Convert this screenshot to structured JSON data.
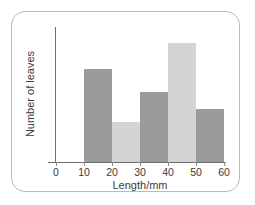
{
  "chart_data": {
    "type": "bar",
    "title": "",
    "subtitle": "",
    "xlabel": "Length/mm",
    "ylabel": "Number of leaves",
    "grid": false,
    "legend": "none",
    "xlim": [
      0,
      60
    ],
    "bin_width": 10,
    "xticks": [
      "0",
      "10",
      "20",
      "30",
      "40",
      "50",
      "60"
    ],
    "xtick_values": [
      0,
      10,
      20,
      30,
      40,
      50,
      60
    ],
    "yticks": [],
    "ylim": [
      0,
      10
    ],
    "categories": [
      "10-20",
      "20-30",
      "30-40",
      "40-50",
      "50-60"
    ],
    "values": [
      7,
      3,
      5.3,
      9,
      4
    ],
    "bar_colors": [
      "#9b9b9b",
      "#d4d4d4",
      "#9b9b9b",
      "#d4d4d4",
      "#9b9b9b"
    ],
    "bars": [
      {
        "label": "10-20",
        "x0": 10,
        "x1": 20,
        "value": 7,
        "color": "#9b9b9b"
      },
      {
        "label": "20-30",
        "x0": 20,
        "x1": 30,
        "value": 3,
        "color": "#d4d4d4"
      },
      {
        "label": "30-40",
        "x0": 30,
        "x1": 40,
        "value": 5.3,
        "color": "#9b9b9b"
      },
      {
        "label": "40-50",
        "x0": 40,
        "x1": 50,
        "value": 9,
        "color": "#d4d4d4"
      },
      {
        "label": "50-60",
        "x0": 50,
        "x1": 60,
        "value": 4,
        "color": "#9b9b9b"
      }
    ],
    "axis_color": "#6f6f6f",
    "frame_color": "#b9b9b9",
    "background": "#ffffff"
  }
}
